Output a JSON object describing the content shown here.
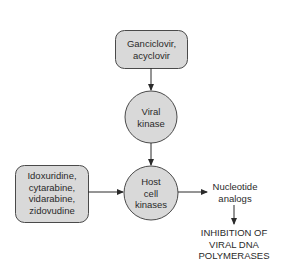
{
  "diagram": {
    "title": "",
    "colors": {
      "node_fill": "#d9d9d9",
      "node_stroke": "#4a4a4a",
      "edge": "#2a2a2a",
      "text": "#2a2a2a",
      "background": "#ffffff"
    },
    "nodes": {
      "ganciclovir_box": {
        "shape": "rounded-rect",
        "lines": [
          "Ganciclovir,",
          "acyclovir"
        ]
      },
      "viral_kinase": {
        "shape": "circle",
        "lines": [
          "Viral",
          "kinase"
        ]
      },
      "idoxuridine_box": {
        "shape": "rounded-rect",
        "lines": [
          "Idoxuridine,",
          "cytarabine,",
          "vidarabine,",
          "zidovudine"
        ]
      },
      "host_cell_kinases": {
        "shape": "circle",
        "lines": [
          "Host",
          "cell",
          "kinases"
        ]
      },
      "nucleotide_analogs": {
        "shape": "text",
        "lines": [
          "Nucleotide",
          "analogs"
        ]
      },
      "inhibition": {
        "shape": "text",
        "lines": [
          "INHIBITION OF",
          "VIRAL DNA",
          "POLYMERASES"
        ]
      }
    },
    "edges": [
      {
        "from": "ganciclovir_box",
        "to": "viral_kinase"
      },
      {
        "from": "viral_kinase",
        "to": "host_cell_kinases"
      },
      {
        "from": "idoxuridine_box",
        "to": "host_cell_kinases"
      },
      {
        "from": "host_cell_kinases",
        "to": "nucleotide_analogs"
      },
      {
        "from": "nucleotide_analogs",
        "to": "inhibition"
      }
    ]
  }
}
